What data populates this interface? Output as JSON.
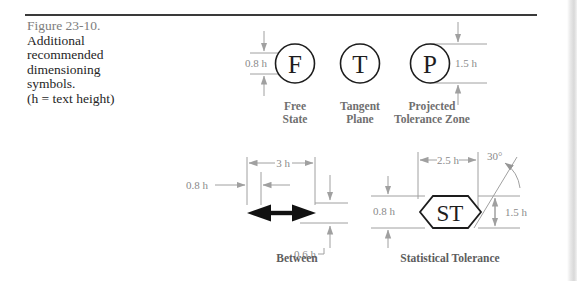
{
  "caption": {
    "figure_number": "Figure 23-10.",
    "lines": [
      "Additional",
      "recommended",
      "dimensioning",
      "symbols.",
      "(h = text height)"
    ]
  },
  "colors": {
    "rule": "#3a3a3a",
    "dimension_line": "#a0a0a0",
    "symbol_outline": "#1d1d1d",
    "dim_text": "#8a8a8a",
    "label_text": "#6f6f6f",
    "figure_number_text": "#7d7d7d",
    "body_text": "#262626"
  },
  "symbols_row": [
    {
      "glyph": "F",
      "shape": "circle",
      "label_line1": "Free",
      "label_line2": "State",
      "dimension": "0.8 h",
      "dimension_side": "left"
    },
    {
      "glyph": "T",
      "shape": "circle",
      "label_line1": "Tangent",
      "label_line2": "Plane",
      "dimension": "",
      "dimension_side": ""
    },
    {
      "glyph": "P",
      "shape": "circle",
      "label_line1": "Projected",
      "label_line2": "Tolerance Zone",
      "dimension": "1.5 h",
      "dimension_side": "right"
    }
  ],
  "between_figure": {
    "caption": "Between",
    "symbol": "double-headed-arrow",
    "dim_width": "3 h",
    "dim_left": "0.8 h",
    "dim_height": "0.6 h"
  },
  "statistical_figure": {
    "caption": "Statistical Tolerance",
    "glyph": "ST",
    "shape": "hexagon",
    "dim_width": "2.5 h",
    "dim_left": "0.8 h",
    "dim_height": "1.5 h",
    "dim_angle": "30°"
  }
}
